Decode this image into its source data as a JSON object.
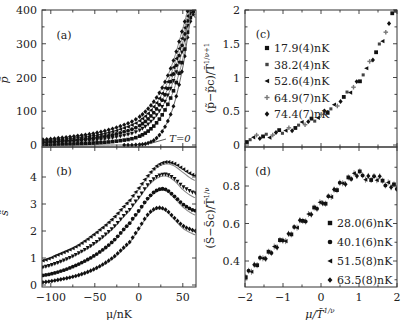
{
  "chart_data": [
    {
      "panel": "(a)",
      "type": "scatter",
      "ylabel": "p̃",
      "xlabel": "",
      "xlim": [
        -110,
        65
      ],
      "ylim": [
        0,
        400
      ],
      "yticks": [
        0,
        100,
        200,
        300,
        400
      ],
      "xticks": [
        -100,
        -50,
        0,
        50
      ],
      "annotation": "T=0",
      "series": [
        {
          "name": "T=0",
          "x": [
            -110,
            -90,
            -70,
            -50,
            -30,
            -10,
            0,
            10,
            20,
            30,
            40,
            50,
            60
          ],
          "y": [
            0,
            0,
            0,
            0,
            0,
            0,
            1,
            5,
            20,
            55,
            120,
            230,
            380
          ]
        },
        {
          "name": "17.9nK",
          "x": [
            -110,
            -90,
            -70,
            -50,
            -30,
            -10,
            0,
            10,
            20,
            30,
            40,
            50,
            60
          ],
          "y": [
            2,
            3,
            4,
            6,
            10,
            17,
            25,
            40,
            65,
            105,
            165,
            255,
            390
          ]
        },
        {
          "name": "38.2nK",
          "x": [
            -110,
            -90,
            -70,
            -50,
            -30,
            -10,
            0,
            10,
            20,
            30,
            40,
            50,
            60
          ],
          "y": [
            5,
            7,
            10,
            14,
            21,
            32,
            42,
            60,
            88,
            130,
            195,
            285,
            400
          ]
        },
        {
          "name": "52.6nK",
          "x": [
            -110,
            -90,
            -70,
            -50,
            -30,
            -10,
            0,
            10,
            20,
            30,
            40,
            50,
            60
          ],
          "y": [
            8,
            11,
            15,
            21,
            30,
            44,
            56,
            76,
            106,
            150,
            215,
            305,
            410
          ]
        },
        {
          "name": "64.9nK",
          "x": [
            -110,
            -90,
            -70,
            -50,
            -30,
            -10,
            0,
            10,
            20,
            30,
            40,
            50,
            60
          ],
          "y": [
            12,
            16,
            21,
            28,
            39,
            56,
            70,
            92,
            124,
            170,
            235,
            325,
            420
          ]
        },
        {
          "name": "74.4nK",
          "x": [
            -110,
            -90,
            -70,
            -50,
            -30,
            -10,
            0,
            10,
            20,
            30,
            40,
            50,
            60
          ],
          "y": [
            16,
            21,
            27,
            35,
            48,
            66,
            82,
            106,
            140,
            188,
            255,
            345,
            430
          ]
        }
      ]
    },
    {
      "panel": "(b)",
      "type": "scatter",
      "ylabel": "s̃",
      "xlabel": "μ/nK",
      "xlim": [
        -110,
        65
      ],
      "ylim": [
        0,
        4.8
      ],
      "yticks": [
        0,
        1,
        2,
        3,
        4
      ],
      "xticks": [
        -100,
        -50,
        0,
        50
      ],
      "series": [
        {
          "name": "28.0nK",
          "x": [
            -110,
            -90,
            -70,
            -50,
            -30,
            -10,
            0,
            10,
            20,
            30,
            40,
            50,
            60,
            65
          ],
          "y": [
            0.1,
            0.2,
            0.35,
            0.6,
            1.0,
            1.6,
            2.1,
            2.6,
            2.85,
            2.8,
            2.5,
            2.2,
            2.05,
            2.0
          ]
        },
        {
          "name": "40.1nK",
          "x": [
            -110,
            -90,
            -70,
            -50,
            -30,
            -10,
            0,
            10,
            20,
            30,
            40,
            50,
            60,
            65
          ],
          "y": [
            0.35,
            0.5,
            0.75,
            1.1,
            1.6,
            2.3,
            2.75,
            3.2,
            3.5,
            3.55,
            3.3,
            3.0,
            2.8,
            2.75
          ]
        },
        {
          "name": "51.5nK",
          "x": [
            -110,
            -90,
            -70,
            -50,
            -30,
            -10,
            0,
            10,
            20,
            30,
            40,
            50,
            60,
            65
          ],
          "y": [
            0.65,
            0.85,
            1.15,
            1.55,
            2.1,
            2.8,
            3.25,
            3.7,
            4.0,
            4.1,
            3.95,
            3.65,
            3.45,
            3.4
          ]
        },
        {
          "name": "63.5nK",
          "x": [
            -110,
            -90,
            -70,
            -50,
            -30,
            -10,
            0,
            10,
            20,
            30,
            40,
            50,
            60,
            65
          ],
          "y": [
            0.9,
            1.15,
            1.45,
            1.9,
            2.45,
            3.15,
            3.6,
            4.05,
            4.4,
            4.55,
            4.5,
            4.3,
            4.1,
            4.05
          ]
        }
      ]
    },
    {
      "panel": "(c)",
      "type": "scatter",
      "ylabel": "(p̃−p̃c)/T̃^(1/ν+1)",
      "xlabel": "",
      "xlim": [
        -2,
        2
      ],
      "ylim": [
        0,
        2
      ],
      "yticks": [
        0,
        0.5,
        1,
        1.5,
        2
      ],
      "xticks": [
        -2,
        -1,
        0,
        1,
        2
      ],
      "legend": [
        "17.9(4)nK",
        "38.2(4)nK",
        "52.6(4)nK",
        "64.9(7)nK",
        "74.4(7)nK"
      ],
      "legend_markers": [
        "square",
        "square-small",
        "triangle-left",
        "plus",
        "diamond"
      ],
      "x": [
        -1.95,
        -1.8,
        -1.6,
        -1.4,
        -1.2,
        -1.0,
        -0.8,
        -0.6,
        -0.4,
        -0.2,
        0,
        0.2,
        0.4,
        0.6,
        0.8,
        1.0,
        1.2,
        1.4,
        1.6,
        1.8,
        1.95
      ],
      "y": [
        0.08,
        0.1,
        0.12,
        0.14,
        0.17,
        0.2,
        0.24,
        0.28,
        0.33,
        0.38,
        0.44,
        0.51,
        0.6,
        0.7,
        0.82,
        0.96,
        1.13,
        1.32,
        1.55,
        1.8,
        2.0
      ]
    },
    {
      "panel": "(d)",
      "type": "scatter",
      "ylabel": "(S̃−S̃c)/T̃^(1/ν)",
      "xlabel": "μ/T̃^(1/ν)",
      "xlim": [
        -2,
        2
      ],
      "ylim": [
        0.26,
        0.99
      ],
      "yticks": [
        0.4,
        0.6,
        0.8
      ],
      "xticks": [
        -2,
        -1,
        0,
        1,
        2
      ],
      "legend": [
        "28.0(6)nK",
        "40.1(6)nK",
        "51.5(8)nK",
        "63.5(8)nK"
      ],
      "legend_markers": [
        "square",
        "circle",
        "triangle-left",
        "diamond"
      ],
      "x": [
        -2.0,
        -1.8,
        -1.6,
        -1.4,
        -1.2,
        -1.0,
        -0.8,
        -0.6,
        -0.4,
        -0.2,
        0,
        0.2,
        0.4,
        0.6,
        0.8,
        1.0,
        1.2,
        1.4,
        1.6,
        1.8,
        2.0
      ],
      "y": [
        0.33,
        0.36,
        0.4,
        0.44,
        0.47,
        0.51,
        0.55,
        0.59,
        0.63,
        0.67,
        0.7,
        0.74,
        0.78,
        0.82,
        0.85,
        0.86,
        0.85,
        0.84,
        0.83,
        0.81,
        0.79
      ]
    }
  ],
  "labels": {
    "a": "(a)",
    "b": "(b)",
    "c": "(c)",
    "d": "(d)",
    "a_ylabel": "p̃",
    "b_ylabel": "s̃",
    "left_xlabel": "μ/nK",
    "right_xlabel": "μ/T̃",
    "right_xlabel_sup": "1/ν",
    "c_ylabel": "(p̃−p̃c)/T̃",
    "c_ylabel_sup": "1/ν+1",
    "d_ylabel": "(S̃−S̃c)/T̃",
    "d_ylabel_sup": "1/ν",
    "t0": "T=0"
  }
}
